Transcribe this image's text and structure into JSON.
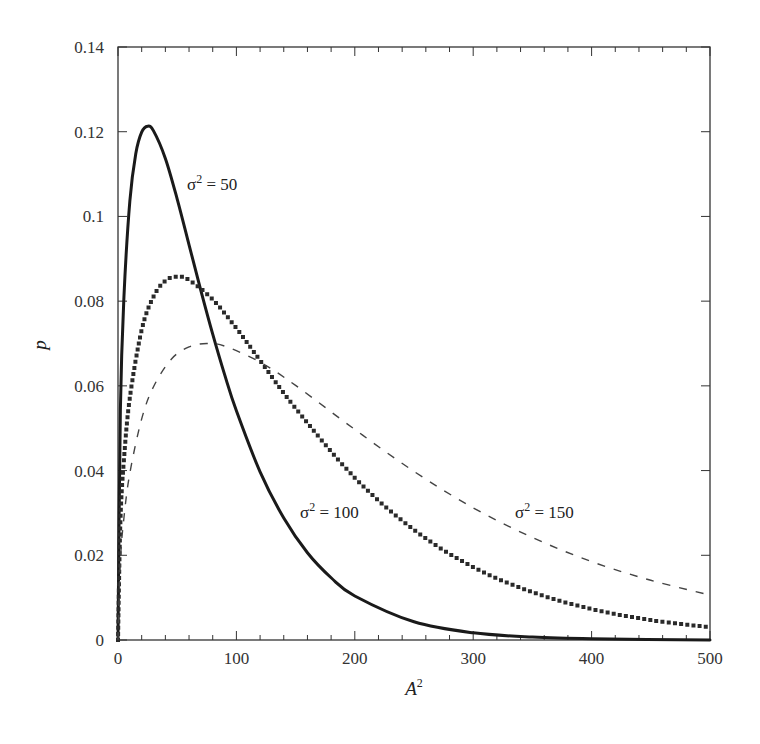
{
  "chart_data": {
    "type": "line",
    "title": "",
    "xlabel": "A²",
    "xlabel_base": "A",
    "xlabel_sup": "2",
    "ylabel": "p",
    "xlim": [
      0,
      500
    ],
    "ylim": [
      0,
      0.14
    ],
    "grid": false,
    "legend": "none (inline annotations)",
    "x_ticks": [
      0,
      100,
      200,
      300,
      400,
      500
    ],
    "x_tick_labels": [
      "0",
      "100",
      "200",
      "300",
      "400",
      "500"
    ],
    "x_minor_step": 20,
    "y_ticks": [
      0,
      0.02,
      0.04,
      0.06,
      0.08,
      0.1,
      0.12,
      0.14
    ],
    "y_tick_labels": [
      "0",
      "0.02",
      "0.04",
      "0.06",
      "0.08",
      "0.1",
      "0.12",
      "0.14"
    ],
    "series": [
      {
        "name": "σ² = 50",
        "style": "solid",
        "x": [
          0,
          2,
          5,
          10,
          15,
          20,
          25,
          30,
          40,
          50,
          60,
          70,
          80,
          90,
          100,
          120,
          140,
          160,
          180,
          200,
          250,
          300,
          350,
          400,
          500
        ],
        "values": [
          0,
          0.0542,
          0.0809,
          0.1036,
          0.1148,
          0.1199,
          0.1213,
          0.1202,
          0.1137,
          0.1041,
          0.0933,
          0.0825,
          0.0722,
          0.0627,
          0.0541,
          0.0397,
          0.0288,
          0.0206,
          0.0147,
          0.0104,
          0.0043,
          0.0017,
          0.0007,
          0.0003,
          0.0
        ]
      },
      {
        "name": "σ² = 100",
        "style": "dotted",
        "x": [
          0,
          2,
          5,
          10,
          20,
          30,
          40,
          50,
          60,
          80,
          100,
          120,
          150,
          200,
          250,
          300,
          350,
          400,
          450,
          500
        ],
        "values": [
          0,
          0.0277,
          0.0425,
          0.0572,
          0.0732,
          0.0811,
          0.0848,
          0.0858,
          0.085,
          0.0804,
          0.0736,
          0.066,
          0.0547,
          0.0383,
          0.026,
          0.0172,
          0.0113,
          0.0073,
          0.0047,
          0.003
        ]
      },
      {
        "name": "σ² = 150",
        "style": "dashed",
        "x": [
          0,
          2,
          5,
          10,
          20,
          30,
          45,
          60,
          75,
          90,
          120,
          150,
          200,
          250,
          300,
          350,
          400,
          450,
          500
        ],
        "values": [
          0,
          0.0186,
          0.0288,
          0.0394,
          0.0522,
          0.0598,
          0.0663,
          0.0692,
          0.07,
          0.0694,
          0.0656,
          0.0601,
          0.0497,
          0.0398,
          0.0312,
          0.0242,
          0.0185,
          0.0141,
          0.0106
        ]
      }
    ],
    "annotations": [
      {
        "base": "σ",
        "sup": "2",
        "rest": " = 50",
        "x_px": 187,
        "y_px": 190
      },
      {
        "base": "σ",
        "sup": "2",
        "rest": " = 100",
        "x_px": 300,
        "y_px": 518
      },
      {
        "base": "σ",
        "sup": "2",
        "rest": " = 150",
        "x_px": 515,
        "y_px": 518
      }
    ]
  },
  "colors": {
    "axis": "#333333",
    "solid": "#1a1a1a",
    "dotted": "#2a2a2a",
    "dashed": "#444444",
    "background": "#ffffff"
  }
}
